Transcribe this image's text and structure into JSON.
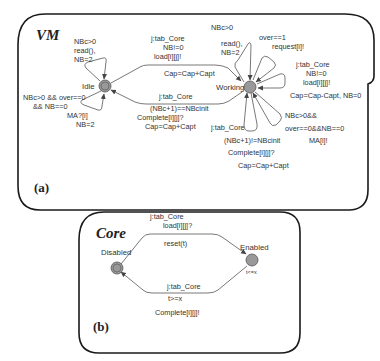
{
  "panels": {
    "vm": {
      "title": "VM",
      "id_label": "(a)",
      "states": {
        "idle": {
          "name": "Idle",
          "initial": true
        },
        "working": {
          "name": "Working",
          "initial": false
        }
      },
      "transitions": {
        "idle_self_top": {
          "lines": [
            "NBc>0",
            "read(),",
            "NB=2"
          ]
        },
        "idle_self_bottom": {
          "lines": [
            "NBc>0 && over==0",
            "&& NB==0",
            "MA?[i]",
            "NB=2"
          ]
        },
        "idle_to_working": {
          "lines": [
            "j:tab_Core",
            "NB!=0",
            "load[i][j]!",
            "Cap=Cap+Capt"
          ]
        },
        "working_to_idle": {
          "lines": [
            "j:tab_Core",
            "(NBc+1)==NBcinit",
            "Complete[i][j]?",
            "Cap=Cap+Capt"
          ]
        },
        "working_self_read": {
          "lines": [
            "NBc>0",
            "read(),",
            "NB=2"
          ]
        },
        "working_self_request": {
          "lines": [
            "over==1",
            "request[i]!"
          ]
        },
        "working_self_load": {
          "lines": [
            "j:tab_Core",
            "NB!=0",
            "load[i][j]!",
            "Cap=Cap-Capt, NB=0"
          ]
        },
        "working_self_ma": {
          "lines": [
            "NBc>0&&",
            "over==0&&NB==0",
            "MA[i]!"
          ]
        },
        "working_self_complete": {
          "lines": [
            "j:tab_Core",
            "(NBc+1)!=NBcinit",
            "Complete[i][j]?",
            "Cap=Cap+Capt"
          ]
        }
      }
    },
    "core": {
      "title": "Core",
      "id_label": "(b)",
      "states": {
        "disabled": {
          "name": "Disabled",
          "initial": true
        },
        "enabled": {
          "name": "Enabled",
          "initial": false,
          "invariant": "t<=x"
        }
      },
      "transitions": {
        "disabled_to_enabled": {
          "lines": [
            "j:tab_Core",
            "load[i][j]?",
            "reset(t)"
          ]
        },
        "enabled_to_disabled": {
          "lines": [
            "j:tab_Core",
            "t>=x",
            "Complete[i][j]!"
          ]
        }
      }
    }
  }
}
